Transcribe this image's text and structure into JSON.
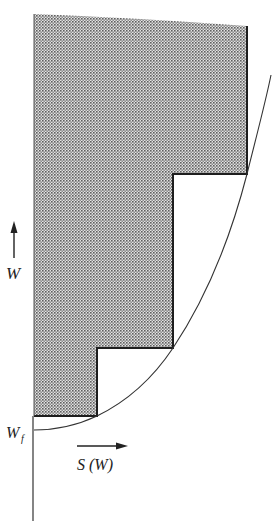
{
  "diagram": {
    "labels": {
      "vertical_axis": "W",
      "baseline": "W",
      "baseline_subscript": "f",
      "horizontal_axis": "S (W)"
    },
    "colors": {
      "ink": "#222222",
      "shade_dot": "#6a6a6a",
      "shade_bg": "#d9d9d9",
      "background": "#ffffff"
    },
    "staircase": {
      "steps": [
        {
          "x": 97,
          "y": 416
        },
        {
          "x": 173,
          "y": 348
        },
        {
          "x": 247,
          "y": 174
        }
      ],
      "left_edge_x": 34,
      "top_left_y": 14,
      "top_right_y": 26
    }
  }
}
